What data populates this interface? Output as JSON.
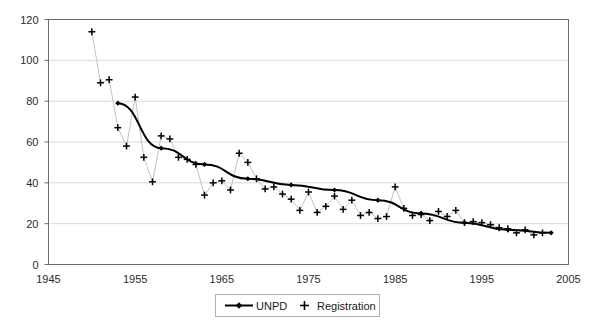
{
  "chart_data": {
    "type": "line",
    "title": "",
    "subtitle": "",
    "xlabel": "",
    "ylabel": "",
    "xlim": [
      1945,
      2005
    ],
    "ylim": [
      0,
      120
    ],
    "xticks": [
      1945,
      1955,
      1965,
      1975,
      1985,
      1995,
      2005
    ],
    "yticks": [
      0,
      20,
      40,
      60,
      80,
      100,
      120
    ],
    "grid": "horizontal",
    "legend_position": "bottom-center",
    "series": [
      {
        "name": "UNPD",
        "marker": "diamond",
        "line": "solid",
        "color": "#000000",
        "x": [
          1953,
          1958,
          1963,
          1968,
          1973,
          1978,
          1983,
          1988,
          1993,
          1998,
          2003
        ],
        "values": [
          79,
          57,
          49,
          42,
          39,
          36.5,
          31.5,
          25,
          20.5,
          17,
          15.5
        ]
      },
      {
        "name": "Registration",
        "marker": "plus",
        "line": "thin-connector",
        "color": "#000000",
        "x": [
          1950,
          1951,
          1952,
          1953,
          1954,
          1955,
          1956,
          1957,
          1958,
          1959,
          1960,
          1961,
          1962,
          1963,
          1964,
          1965,
          1966,
          1967,
          1968,
          1969,
          1970,
          1971,
          1972,
          1973,
          1974,
          1975,
          1976,
          1977,
          1978,
          1979,
          1980,
          1981,
          1982,
          1983,
          1984,
          1985,
          1986,
          1987,
          1988,
          1989,
          1990,
          1991,
          1992,
          1993,
          1994,
          1995,
          1996,
          1997,
          1998,
          1999,
          2000,
          2001,
          2002
        ],
        "values": [
          114,
          89,
          90.5,
          67,
          58,
          82,
          52.5,
          40.5,
          63,
          61.5,
          52.5,
          51.5,
          49,
          34,
          40,
          41,
          36.5,
          54.5,
          50,
          42,
          37,
          38,
          34.5,
          32,
          26.5,
          35.5,
          25.5,
          28.5,
          33.5,
          27,
          31.5,
          24,
          25.5,
          22.5,
          23.5,
          38,
          27.5,
          24,
          24.5,
          21.5,
          26,
          23.5,
          26.5,
          20.5,
          21,
          20.5,
          19.5,
          18,
          17.5,
          15.5,
          17,
          14.5,
          15.5
        ]
      }
    ]
  },
  "legend": {
    "items": [
      {
        "label": "UNPD",
        "marker": "line-diamond"
      },
      {
        "label": "Registration",
        "marker": "plus"
      }
    ]
  },
  "axes": {
    "x_tick_labels": [
      "1945",
      "1955",
      "1965",
      "1975",
      "1985",
      "1995",
      "2005"
    ],
    "y_tick_labels": [
      "0",
      "20",
      "40",
      "60",
      "80",
      "100",
      "120"
    ]
  },
  "colors": {
    "plot_border": "#6e6e6e",
    "gridline": "#d9d9d9",
    "series_primary": "#000000",
    "connector": "#b4b4b4",
    "background": "#ffffff",
    "legend_border": "#b0b0b0"
  }
}
